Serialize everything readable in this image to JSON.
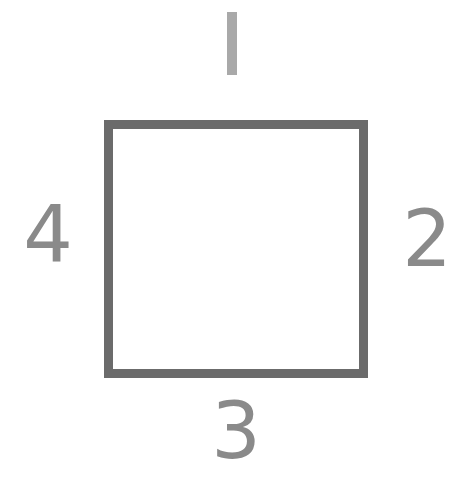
{
  "diagram": {
    "shape": "square",
    "border_color": "#6b6b6b",
    "label_color": "#8a8a8a",
    "top_label_color": "#a9a9a9",
    "labels": {
      "top": "1",
      "right": "2",
      "bottom": "3",
      "left": "4"
    }
  }
}
